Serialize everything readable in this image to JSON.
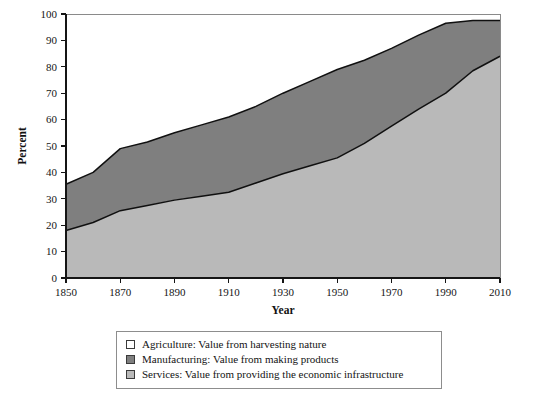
{
  "chart_data": {
    "type": "area",
    "title": "",
    "subtitle": "",
    "xlabel": "Year",
    "ylabel": "Percent",
    "xlim": [
      1850,
      2010
    ],
    "ylim": [
      0,
      100
    ],
    "grid": false,
    "stacked": true,
    "legend_position": "below-plot",
    "xticks": [
      1850,
      1870,
      1890,
      1910,
      1930,
      1950,
      1970,
      1990,
      2010
    ],
    "xtick_labels": [
      "1850",
      "1870",
      "1890",
      "1910",
      "1930",
      "1950",
      "1970",
      "1990",
      "2010"
    ],
    "yticks": [
      0,
      10,
      20,
      30,
      40,
      50,
      60,
      70,
      80,
      90,
      100
    ],
    "ytick_labels": [
      "0",
      "10",
      "20",
      "30",
      "40",
      "50",
      "60",
      "70",
      "80",
      "90",
      "100"
    ],
    "x": [
      1850,
      1860,
      1870,
      1880,
      1890,
      1900,
      1910,
      1920,
      1930,
      1940,
      1950,
      1960,
      1970,
      1980,
      1990,
      2000,
      2010
    ],
    "series": [
      {
        "name": "Services",
        "label": "Services: Value from providing the economic infrastructure",
        "color": "#b9b9b9",
        "stack_order": 1,
        "values": [
          18,
          21,
          25.5,
          27.5,
          29.5,
          31,
          32.5,
          36,
          39.5,
          42.5,
          45.5,
          51,
          57.5,
          64,
          70,
          78.5,
          84
        ]
      },
      {
        "name": "Manufacturing",
        "label": "Manufacturing: Value from making products",
        "color": "#7f7f7f",
        "stack_order": 2,
        "values": [
          17.5,
          19,
          23.5,
          24,
          25.5,
          27,
          28.5,
          29,
          30.5,
          32,
          33.5,
          31.5,
          29.5,
          28,
          26.5,
          19,
          13.5
        ]
      },
      {
        "name": "Agriculture",
        "label": "Agriculture: Value from harvesting nature",
        "color": "#ffffff",
        "stack_order": 3,
        "values": [
          64.5,
          60,
          51,
          48.5,
          45,
          42,
          39,
          35,
          30,
          25.5,
          21,
          17.5,
          13,
          8,
          3.5,
          2.5,
          2.5
        ]
      }
    ],
    "cumulative_services": [
      18,
      21,
      25.5,
      27.5,
      29.5,
      31,
      32.5,
      36,
      39.5,
      42.5,
      45.5,
      51,
      57.5,
      64,
      70,
      78.5,
      84
    ],
    "cumulative_services_plus_manufacturing": [
      35.5,
      40,
      49,
      51.5,
      55,
      58,
      61,
      65,
      70,
      74.5,
      79,
      82.5,
      87,
      92,
      96.5,
      97.5,
      97.5
    ],
    "annotations": []
  },
  "legend": {
    "items": [
      {
        "label": "Agriculture: Value from harvesting nature",
        "color": "#ffffff"
      },
      {
        "label": "Manufacturing: Value from making products",
        "color": "#7f7f7f"
      },
      {
        "label": "Services: Value from providing the economic infrastructure",
        "color": "#b9b9b9"
      }
    ]
  }
}
